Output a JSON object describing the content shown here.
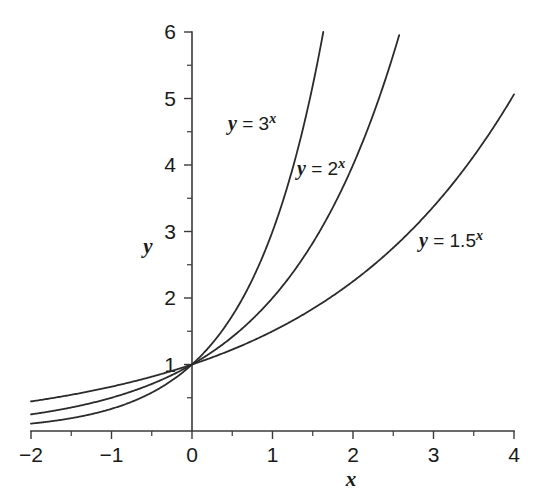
{
  "chart_data": {
    "type": "line",
    "title": "",
    "subtitle": "",
    "xlabel": "x",
    "ylabel": "y",
    "xlim": [
      -2,
      4
    ],
    "ylim": [
      0,
      6
    ],
    "grid": false,
    "legend": "inline-annotations",
    "background_color": "#ffffff",
    "line_color": "#2b2b2b",
    "axis_color": "#3a3a3a",
    "x_ticks": [
      -2,
      -1,
      0,
      1,
      2,
      3,
      4
    ],
    "x_tick_labels": [
      "−2",
      "−1",
      "0",
      "1",
      "2",
      "3",
      "4"
    ],
    "x_minor_ticks": [
      -1.5,
      -0.5,
      0.5,
      1.5,
      2.5,
      3.5
    ],
    "y_ticks": [
      1,
      2,
      3,
      4,
      5,
      6
    ],
    "y_tick_labels": [
      "1",
      "2",
      "3",
      "4",
      "5",
      "6"
    ],
    "y_minor_ticks": [
      0.5,
      1.5,
      2.5,
      3.5,
      4.5,
      5.5
    ],
    "series": [
      {
        "name": "y = 3^x",
        "label_text_prefix": "y",
        "label_equals": " = ",
        "label_base": "3",
        "label_exponent": "x",
        "base": 3,
        "x_start": -2,
        "x_end": 1.6309,
        "label_x": 228,
        "label_y": 130,
        "x": [
          -2,
          -1.75,
          -1.5,
          -1.25,
          -1,
          -0.75,
          -0.5,
          -0.25,
          0,
          0.25,
          0.5,
          0.75,
          1,
          1.25,
          1.5,
          1.6309
        ],
        "y": [
          0.1111,
          0.1462,
          0.1925,
          0.2532,
          0.3333,
          0.4387,
          0.5774,
          0.7598,
          1,
          1.3161,
          1.7321,
          2.2795,
          3,
          3.9482,
          5.1962,
          6
        ]
      },
      {
        "name": "y = 2^x",
        "label_text_prefix": "y",
        "label_equals": " = ",
        "label_base": "2",
        "label_exponent": "x",
        "base": 2,
        "x_start": -2,
        "x_end": 2.585,
        "label_x": 297,
        "label_y": 175,
        "x": [
          -2,
          -1.75,
          -1.5,
          -1.25,
          -1,
          -0.75,
          -0.5,
          -0.25,
          0,
          0.25,
          0.5,
          0.75,
          1,
          1.25,
          1.5,
          1.75,
          2,
          2.25,
          2.5,
          2.585
        ],
        "y": [
          0.25,
          0.2973,
          0.3536,
          0.4204,
          0.5,
          0.5946,
          0.7071,
          0.8409,
          1,
          1.1892,
          1.4142,
          1.6818,
          2,
          2.3784,
          2.8284,
          3.3636,
          4,
          4.7568,
          5.6569,
          6
        ]
      },
      {
        "name": "y = 1.5^x",
        "label_text_prefix": "y",
        "label_equals": " = ",
        "label_base": "1.5",
        "label_exponent": "x",
        "base": 1.5,
        "x_start": -2,
        "x_end": 4,
        "label_x": 419,
        "label_y": 247,
        "x": [
          -2,
          -1.5,
          -1,
          -0.5,
          0,
          0.5,
          1,
          1.5,
          2,
          2.5,
          3,
          3.5,
          4
        ],
        "y": [
          0.4444,
          0.5443,
          0.6667,
          0.8165,
          1,
          1.2247,
          1.5,
          1.8371,
          2.25,
          2.7557,
          3.375,
          4.1335,
          5.0625
        ]
      }
    ]
  },
  "geometry": {
    "x_origin_px": 192,
    "y_origin_px": 431,
    "px_per_x_unit": 80.5,
    "px_per_y_unit": 66.5,
    "tick_len_major": 8,
    "tick_len_minor": 5
  },
  "labels": {
    "y_axis_name": "y",
    "x_axis_name": "x"
  }
}
